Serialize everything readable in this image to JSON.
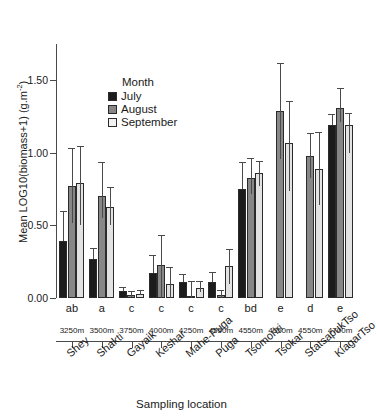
{
  "chart_data": {
    "type": "bar",
    "title": "",
    "xlabel": "Sampling location",
    "ylabel": "Mean LOG10(biomass+1) (g.m",
    "ylabel_sup": "-2",
    "ylabel_tail": ")",
    "ylim": [
      0.0,
      1.75
    ],
    "yticks": [
      "0.00",
      "0.50",
      "1.00",
      "1.50"
    ],
    "ytick_values": [
      0.0,
      0.5,
      1.0,
      1.5
    ],
    "grid": false,
    "legend_position": "upper-left-inset",
    "legend_title": "Month",
    "categories": [
      "Shey",
      "Shakti",
      "Gayaik",
      "Keshar",
      "Mahe-Puga",
      "Puga",
      "Tsomoriri",
      "Tsokar",
      "StatsapukTso",
      "KiagarTso"
    ],
    "elevations": [
      "3250m",
      "3500m",
      "3750m",
      "4000m",
      "4250m",
      "4550m",
      "4550m",
      "4550m",
      "4550m",
      "4700m"
    ],
    "significance_letters": [
      "ab",
      "a",
      "c",
      "c",
      "c",
      "c",
      "bd",
      "e",
      "d",
      "e"
    ],
    "series": [
      {
        "name": "July",
        "color": "#1c1c1c",
        "values": [
          0.39,
          0.27,
          0.05,
          0.17,
          0.11,
          0.11,
          0.75,
          null,
          null,
          1.19
        ],
        "err_low": [
          0.39,
          0.27,
          0.05,
          0.17,
          0.11,
          0.11,
          0.75,
          null,
          null,
          1.19
        ],
        "err_high": [
          0.59,
          0.34,
          0.07,
          0.29,
          0.16,
          0.17,
          0.93,
          null,
          null,
          1.26
        ]
      },
      {
        "name": "August",
        "color": "#878787",
        "values": [
          0.77,
          0.7,
          0.02,
          0.23,
          0.01,
          0.02,
          0.83,
          1.29,
          0.98,
          1.31
        ],
        "err_low": [
          0.52,
          0.55,
          0.01,
          0.0,
          0.0,
          0.0,
          0.72,
          0.96,
          0.83,
          1.21
        ],
        "err_high": [
          1.03,
          0.93,
          0.04,
          0.43,
          0.11,
          0.05,
          0.96,
          1.61,
          1.13,
          1.44
        ]
      },
      {
        "name": "September",
        "color": "#e2e2e2",
        "values": [
          0.79,
          0.63,
          0.03,
          0.1,
          0.07,
          0.22,
          0.86,
          1.07,
          0.89,
          1.19
        ],
        "err_low": [
          0.5,
          0.5,
          0.02,
          0.0,
          0.04,
          0.1,
          0.77,
          0.74,
          0.64,
          1.0
        ],
        "err_high": [
          1.04,
          0.76,
          0.05,
          0.21,
          0.11,
          0.33,
          0.94,
          1.35,
          1.14,
          1.27
        ]
      }
    ]
  },
  "legend": {
    "title": "Month",
    "items": [
      {
        "label": "July",
        "key": "july"
      },
      {
        "label": "August",
        "key": "august"
      },
      {
        "label": "September",
        "key": "september"
      }
    ]
  },
  "axes": {
    "x_title": "Sampling location",
    "y_title_prefix": "Mean LOG10(biomass+1) (g.m",
    "y_title_sup": "-2",
    "y_title_suffix": ")"
  }
}
